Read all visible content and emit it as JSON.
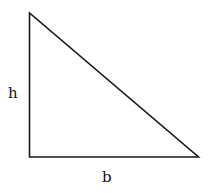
{
  "diagram": {
    "type": "right-triangle",
    "vertices": {
      "top": [
        29.5,
        13
      ],
      "bottom_left": [
        29.5,
        157
      ],
      "bottom_right": [
        198.5,
        157
      ]
    },
    "stroke_color": "#1a1a1a",
    "labels": {
      "height": "h",
      "base": "b"
    }
  }
}
